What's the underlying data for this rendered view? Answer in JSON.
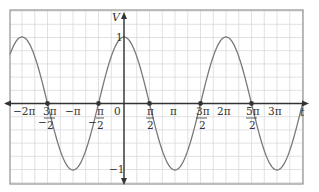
{
  "chart_data": {
    "type": "line",
    "title": "",
    "xlabel": "t",
    "ylabel": "V",
    "function": "V = cos(t)",
    "xlim": [
      -2.235,
      3.51
    ],
    "xlim_units": "multiples of pi",
    "ylim": [
      -1,
      1
    ],
    "grid": true,
    "x_tick_labels": [
      "-2π",
      "-3π/2",
      "-π",
      "-π/2",
      "0",
      "π/2",
      "π",
      "3π/2",
      "2π",
      "5π/2",
      "3π"
    ],
    "x_tick_values_pi": [
      -2,
      -1.5,
      -1,
      -0.5,
      0,
      0.5,
      1,
      1.5,
      2,
      2.5,
      3
    ],
    "y_tick_labels": [
      "1",
      "-1"
    ],
    "y_tick_values": [
      1,
      -1
    ],
    "marked_points": [
      {
        "t": "-3π/2",
        "V": 0
      },
      {
        "t": "-π/2",
        "V": 0
      },
      {
        "t": "π/2",
        "V": 0
      },
      {
        "t": "3π/2",
        "V": 0
      },
      {
        "t": "5π/2",
        "V": 0
      }
    ],
    "series": [
      {
        "name": "cos t",
        "color": "#7a7a7a",
        "x_pi": [
          -2,
          -1.5,
          -1,
          -0.5,
          0,
          0.5,
          1,
          1.5,
          2,
          2.5,
          3
        ],
        "values": [
          1,
          0,
          -1,
          0,
          1,
          0,
          -1,
          0,
          1,
          0,
          -1
        ]
      }
    ]
  },
  "labels": {
    "y_axis": "V",
    "x_axis": "t",
    "y_one": "1",
    "y_minus_one": "−1",
    "origin": "0",
    "neg_two_pi": "−2π",
    "neg_pi": "−π",
    "pi": "π",
    "two_pi": "2π",
    "three_pi": "3π",
    "neg_three_pi_num": "3π",
    "neg_pi_num": "π",
    "pi_num": "π",
    "three_pi_num": "3π",
    "five_pi_num": "5π",
    "den_two": "2",
    "minus": "−"
  },
  "colors": {
    "grid": "#d9d9d9",
    "frame": "#9a9a9a",
    "axis": "#333333",
    "curve": "#7a7a7a",
    "dot": "#333333"
  }
}
